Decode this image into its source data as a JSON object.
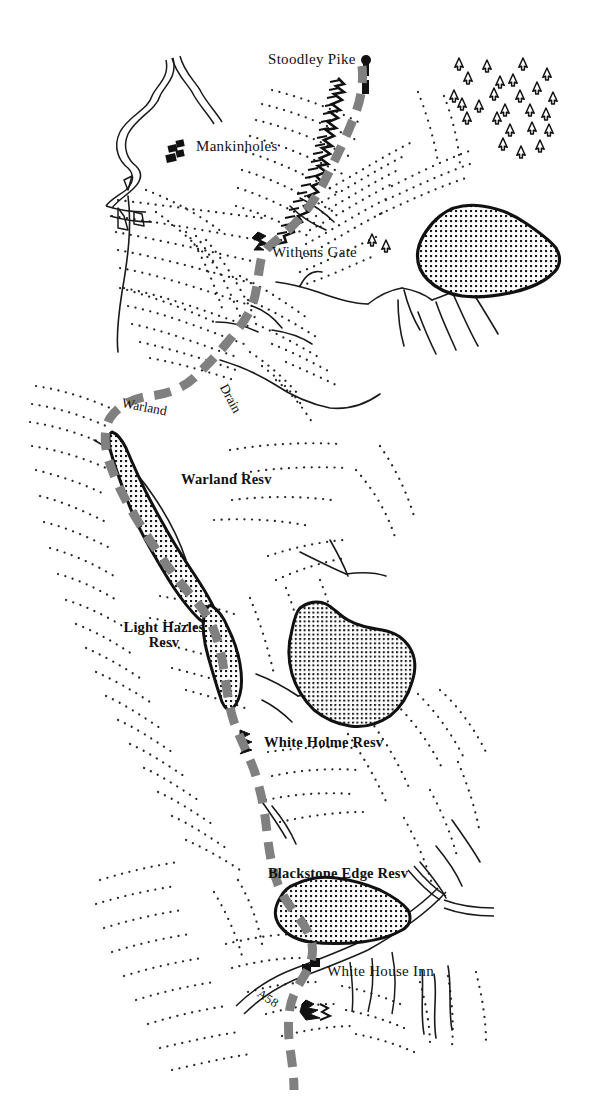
{
  "map": {
    "title": "Pennine Way — Stoodley Pike to White House Inn",
    "background_color": "#ffffff",
    "ink_color": "#111111",
    "trail_color": "#808080",
    "water_fill": "#ffffff",
    "width": 589,
    "height": 1109
  },
  "legend_semantics": {
    "dashed_gray_line": "long distance footpath / Pennine Way",
    "cross_hatch_polygon": "reservoir water body",
    "dotted_radiating_lines": "slope hachures / rough ground",
    "small_black_rectangles": "buildings",
    "triangle_on_stem": "coniferous trees / plantation",
    "double_thin_lines": "road"
  },
  "labels": [
    {
      "id": "stoodley-pike",
      "text": "Stoodley Pike",
      "type": "place",
      "x": 268,
      "y": 52,
      "rotate": 0
    },
    {
      "id": "mankinholes",
      "text": "Mankinholes",
      "type": "place",
      "x": 196,
      "y": 139,
      "rotate": 0
    },
    {
      "id": "withens-gate",
      "text": "Withens Gate",
      "type": "place",
      "x": 272,
      "y": 245,
      "rotate": 0
    },
    {
      "id": "drain",
      "text": "Drain",
      "type": "water",
      "x": 223,
      "y": 378,
      "rotate": 62
    },
    {
      "id": "warland",
      "text": "Warland",
      "type": "water",
      "x": 122,
      "y": 396,
      "rotate": 11
    },
    {
      "id": "warland-resv",
      "text": "Warland Resv",
      "type": "reservoir",
      "x": 181,
      "y": 472,
      "rotate": 0
    },
    {
      "id": "light-hazles-resv",
      "text": "Light Hazles\nResv",
      "type": "reservoir",
      "x": 112,
      "y": 620,
      "rotate": 0
    },
    {
      "id": "white-holme-resv",
      "text": "White Holme Resv",
      "type": "reservoir",
      "x": 264,
      "y": 735,
      "rotate": 0
    },
    {
      "id": "blackstone-edge-resv",
      "text": "Blackstone Edge Resv",
      "type": "reservoir",
      "x": 268,
      "y": 866,
      "rotate": 0
    },
    {
      "id": "white-house-inn",
      "text": "White House Inn",
      "type": "place",
      "x": 327,
      "y": 964,
      "rotate": 0
    },
    {
      "id": "a58",
      "text": "A58",
      "type": "road",
      "x": 258,
      "y": 986,
      "rotate": 33
    }
  ],
  "features": {
    "trail_name": "Pennine Way",
    "reservoirs": [
      "Warland Resv",
      "Light Hazles Resv",
      "White Holme Resv",
      "Blackstone Edge Resv"
    ],
    "settlements": [
      "Mankinholes",
      "White House Inn"
    ],
    "summits": [
      "Stoodley Pike"
    ],
    "gates": [
      "Withens Gate"
    ],
    "watercourses": [
      "Warland",
      "Drain"
    ],
    "roads": [
      "A58"
    ],
    "tree_count": 26
  }
}
